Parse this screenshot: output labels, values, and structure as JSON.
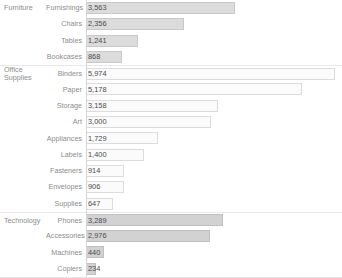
{
  "chart_data": {
    "type": "bar",
    "title": "",
    "subtitle": "",
    "xlabel": "",
    "ylabel": "",
    "orientation": "horizontal",
    "grid": false,
    "legend": "none",
    "value_labels": true,
    "xlim": [
      0,
      5974
    ],
    "axis_origin_value": 0,
    "group_field": "Category",
    "category_field": "Sub-Category",
    "value_field": "Sales",
    "groups": [
      {
        "name": "Furniture",
        "tone": "tone-a",
        "color": "#dcdcdc",
        "rows": [
          {
            "label": "Furnishings",
            "value": 3563,
            "value_text": "3,563"
          },
          {
            "label": "Chairs",
            "value": 2356,
            "value_text": "2,356"
          },
          {
            "label": "Tables",
            "value": 1241,
            "value_text": "1,241"
          },
          {
            "label": "Bookcases",
            "value": 868,
            "value_text": "868"
          }
        ]
      },
      {
        "name": "Office Supplies",
        "tone": "tone-b",
        "color": "#fbfbfb",
        "rows": [
          {
            "label": "Binders",
            "value": 5974,
            "value_text": "5,974"
          },
          {
            "label": "Paper",
            "value": 5178,
            "value_text": "5,178"
          },
          {
            "label": "Storage",
            "value": 3158,
            "value_text": "3,158"
          },
          {
            "label": "Art",
            "value": 3000,
            "value_text": "3,000"
          },
          {
            "label": "Appliances",
            "value": 1729,
            "value_text": "1,729"
          },
          {
            "label": "Labels",
            "value": 1400,
            "value_text": "1,400"
          },
          {
            "label": "Fasteners",
            "value": 914,
            "value_text": "914"
          },
          {
            "label": "Envelopes",
            "value": 906,
            "value_text": "906"
          },
          {
            "label": "Supplies",
            "value": 647,
            "value_text": "647"
          }
        ]
      },
      {
        "name": "Technology",
        "tone": "tone-c",
        "color": "#d2d2d2",
        "rows": [
          {
            "label": "Phones",
            "value": 3289,
            "value_text": "3,289"
          },
          {
            "label": "Accessories",
            "value": 2976,
            "value_text": "2,976"
          },
          {
            "label": "Machines",
            "value": 440,
            "value_text": "440"
          },
          {
            "label": "Copiers",
            "value": 234,
            "value_text": "234"
          }
        ]
      }
    ]
  }
}
